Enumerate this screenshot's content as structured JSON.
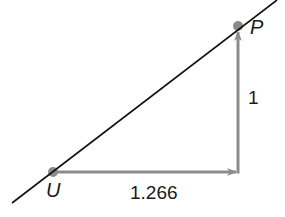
{
  "diagram": {
    "type": "slope-triangle",
    "line": {
      "x1": 12,
      "y1": 203,
      "x2": 277,
      "y2": 0,
      "color": "#111111"
    },
    "points": [
      {
        "id": "U",
        "label": "U",
        "x": 53,
        "y": 172,
        "label_x": 46,
        "label_y": 197
      },
      {
        "id": "P",
        "label": "P",
        "x": 238,
        "y": 26,
        "label_x": 250,
        "label_y": 34
      }
    ],
    "run": {
      "label": "1.266",
      "x1": 53,
      "y1": 172,
      "x2": 238,
      "y2": 172,
      "label_x": 130,
      "label_y": 199
    },
    "rise": {
      "label": "1",
      "x1": 238,
      "y1": 172,
      "x2": 238,
      "y2": 30,
      "label_x": 248,
      "label_y": 104
    },
    "colors": {
      "arrow": "#8c8c8c",
      "dot": "#8a8a8a",
      "line": "#111111",
      "text": "#1a1a1a"
    }
  }
}
